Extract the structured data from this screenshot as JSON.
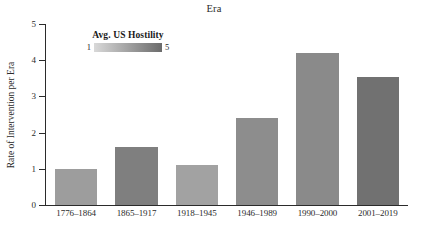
{
  "chart_data": {
    "type": "bar",
    "title": "Era",
    "xlabel": "",
    "ylabel": "Rate of Intervention per Era",
    "categories": [
      "1776–1864",
      "1865–1917",
      "1918–1945",
      "1946–1989",
      "1990–2000",
      "2001–2019"
    ],
    "values": [
      1.0,
      1.6,
      1.1,
      2.4,
      4.2,
      3.55
    ],
    "ylim": [
      0,
      5
    ],
    "yticks": [
      0,
      1,
      2,
      3,
      4,
      5
    ],
    "grid": false,
    "legend": {
      "position": "top-left-inside",
      "title": "Avg. US Hostility",
      "min_label": "1",
      "max_label": "5",
      "scale_min": 1,
      "scale_max": 5,
      "gradient_from": "#d9d9d9",
      "gradient_to": "#6b6b6b"
    },
    "series": [
      {
        "name": "Rate of Intervention per Era",
        "values": [
          1.0,
          1.6,
          1.1,
          2.4,
          4.2,
          3.55
        ],
        "bar_colors": [
          "#9d9d9d",
          "#7f7f7f",
          "#a2a2a2",
          "#8d8d8d",
          "#8a8a8a",
          "#717171"
        ],
        "hostility": [
          2.1,
          3.6,
          1.8,
          2.8,
          2.9,
          4.3
        ]
      }
    ]
  },
  "colors": {
    "axis": "#2b2b2b",
    "background": "#ffffff",
    "text": "#1a1a1a"
  }
}
